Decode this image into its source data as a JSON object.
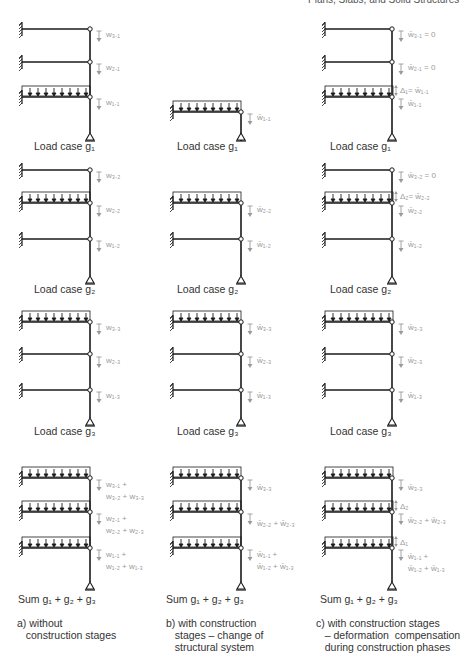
{
  "header": {
    "text": "Plans, Slabs, and Solid Structures"
  },
  "columns": [
    {
      "id": "a",
      "caption": "a) without\n   construction stages",
      "rows": [
        {
          "label": "Load case g₁",
          "loaded_floor": 1,
          "notes": [
            "w₃.₁",
            "w₂.₁",
            "w₁.₁"
          ]
        },
        {
          "label": "Load case g₂",
          "loaded_floor": 2,
          "notes": [
            "w₃.₂",
            "w₂.₂",
            "w₁.₂"
          ]
        },
        {
          "label": "Load case g₃",
          "loaded_floor": 3,
          "notes": [
            "w₃.₃",
            "w₂.₃",
            "w₁.₃"
          ]
        },
        {
          "label": "Sum g₁ + g₂ + g₃",
          "loaded_floor": "all",
          "notes": [
            "w₃.₁ +\nw₃.₂ + w₃.₃",
            "w₂.₁ +\nw₂.₂ + w₂.₃",
            "w₁.₁ +\nw₁.₂ + w₁.₃"
          ]
        }
      ]
    },
    {
      "id": "b",
      "caption": "b) with construction\n   stages – change of\n   structural system",
      "rows": [
        {
          "label": "Load case g₁",
          "floors": 1,
          "notes": [
            "w̄₁.₁"
          ]
        },
        {
          "label": "Load case g₂",
          "floors": 2,
          "notes": [
            "w̄₂.₂",
            "w̄₁.₂"
          ]
        },
        {
          "label": "Load case g₃",
          "floors": 3,
          "notes": [
            "w̄₃.₃",
            "w̄₂.₃",
            "w̄₁.₃"
          ]
        },
        {
          "label": "Sum g₁ + g₂ + g₃",
          "floors": 3,
          "notes": [
            "w̄₃.₃",
            "w̄₂.₂ + w̄₂.₃",
            "w̄₁.₁ +\nw̄₁.₂ + w̄₁.₃"
          ]
        }
      ]
    },
    {
      "id": "c",
      "caption": "c) with construction stages\n   – deformation  compensation\n   during construction phases",
      "rows": [
        {
          "label": "Load case g₁",
          "notes": [
            "w̄₃.₁ = 0",
            "w̄₂.₁ = 0",
            "w̄₁.₁"
          ],
          "delta": "Δ₁= w̄₁.₁"
        },
        {
          "label": "Load case g₂",
          "notes": [
            "w̄₃.₂ = 0",
            "w̄₂.₂",
            "w̄₁.₂"
          ],
          "delta": "Δ₂= w̄₂.₂"
        },
        {
          "label": "Load case g₃",
          "notes": [
            "w̄₃.₃",
            "w̄₂.₃",
            "w̄₁.₃"
          ]
        },
        {
          "label": "Sum g₁ + g₂ + g₃",
          "notes": [
            "w̄₃.₃",
            "w̄₂.₂ + w̄₂.₃",
            "w̄₁.₁ +\nw̄₁.₂ + w̄₁.₃"
          ],
          "deltas": [
            "Δ₂",
            "Δ₁"
          ]
        }
      ]
    }
  ],
  "colors": {
    "structure": "#1a1a1a",
    "annotation": "#9a9a9a",
    "text": "#333333"
  }
}
